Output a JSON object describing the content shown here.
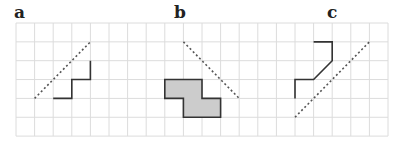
{
  "panels": [
    {
      "label": "a",
      "label_x": 14
    },
    {
      "label": "b",
      "label_x": 174
    },
    {
      "label": "c",
      "label_x": 327
    }
  ],
  "grid": {
    "x0": 16,
    "y0": 23,
    "cell_w": 18.6,
    "cell_h": 18.85,
    "cols": 20,
    "rows": 6,
    "color": "#dcdcdc"
  },
  "colors": {
    "line": "#333333",
    "fill": "#cccccc",
    "dash": "#555555"
  },
  "figures": {
    "a": {
      "mirror_line": [
        [
          1,
          4
        ],
        [
          4,
          1
        ]
      ],
      "path": [
        [
          2,
          4
        ],
        [
          3,
          4
        ],
        [
          3,
          3
        ],
        [
          4,
          3
        ],
        [
          4,
          2
        ]
      ]
    },
    "b": {
      "mirror_line": [
        [
          9,
          1
        ],
        [
          12,
          4
        ]
      ],
      "shape": [
        [
          8,
          3
        ],
        [
          10,
          3
        ],
        [
          10,
          4
        ],
        [
          11,
          4
        ],
        [
          11,
          5
        ],
        [
          9,
          5
        ],
        [
          9,
          4
        ],
        [
          8,
          4
        ]
      ]
    },
    "c": {
      "mirror_line": [
        [
          15,
          5
        ],
        [
          19,
          1
        ]
      ],
      "path": [
        [
          16,
          1
        ],
        [
          17,
          1
        ],
        [
          17,
          2
        ],
        [
          16,
          3
        ],
        [
          15,
          3
        ],
        [
          15,
          4
        ]
      ]
    }
  }
}
